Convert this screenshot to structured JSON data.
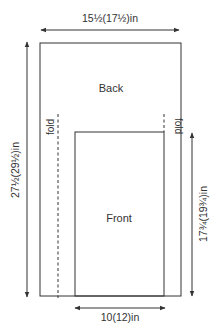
{
  "diagram": {
    "type": "knitting-schematic",
    "colors": {
      "line": "#333333",
      "background": "#ffffff"
    },
    "pieces": {
      "back": {
        "label": "Back"
      },
      "front": {
        "label": "Front"
      }
    },
    "fold_labels": {
      "left": "fold",
      "right": "fold"
    },
    "dimensions": {
      "width_top": "15½(17½)in",
      "height_left": "27½(29½)in",
      "height_right": "17¾(19¾)in",
      "width_bottom": "10(12)in"
    }
  }
}
